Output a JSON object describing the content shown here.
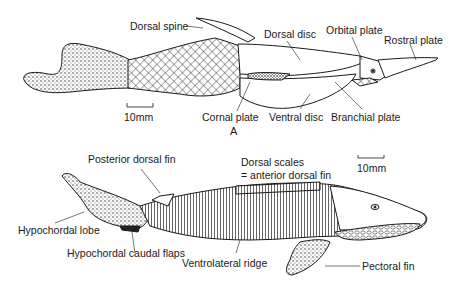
{
  "figure_a": {
    "letter": "A",
    "scale_bar": "10mm",
    "labels": {
      "dorsal_spine": "Dorsal spine",
      "dorsal_disc": "Dorsal disc",
      "orbital_plate": "Orbital plate",
      "rostral_plate": "Rostral plate",
      "cornal_plate": "Cornal plate",
      "ventral_disc": "Ventral disc",
      "branchial_plate": "Branchial plate"
    }
  },
  "figure_b": {
    "scale_bar": "10mm",
    "labels": {
      "posterior_dorsal_fin": "Posterior dorsal fin",
      "dorsal_scales_line1": "Dorsal scales",
      "dorsal_scales_line2": "= anterior dorsal fin",
      "hypochordal_lobe": "Hypochordal lobe",
      "hypochordal_caudal_flaps": "Hypochordal caudal flaps",
      "ventrolateral_ridge": "Ventrolateral ridge",
      "pectoral_fin": "Pectoral fin"
    }
  },
  "colors": {
    "ink": "#1a1a1a",
    "background": "#ffffff"
  }
}
